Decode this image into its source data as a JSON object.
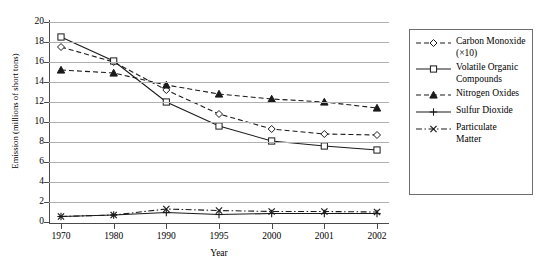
{
  "chart_data": {
    "type": "line",
    "title": "",
    "xlabel": "Year",
    "ylabel": "Emission (millions of short tons)",
    "categories": [
      "1970",
      "1980",
      "1990",
      "1995",
      "2000",
      "2001",
      "2002"
    ],
    "ylim": [
      0,
      20
    ],
    "ytick_step": 2,
    "yticks": [
      "20",
      "18",
      "16",
      "14",
      "12",
      "10",
      "8",
      "6",
      "4",
      "2",
      "0"
    ],
    "grid": true,
    "legend_position": "right",
    "series": [
      {
        "name": "Carbon Monoxide (×10)",
        "label_line1": "Carbon Monoxide",
        "label_line2": "(×10)",
        "marker": "diamond",
        "dash": "dashed",
        "values": [
          17.5,
          16.0,
          13.2,
          10.8,
          9.3,
          8.8,
          8.7
        ]
      },
      {
        "name": "Volatile Organic Compounds",
        "label_line1": "Volatile Organic",
        "label_line2": "Compounds",
        "marker": "square",
        "dash": "solid",
        "values": [
          18.5,
          16.1,
          12.0,
          9.6,
          8.1,
          7.6,
          7.2
        ]
      },
      {
        "name": "Nitrogen Oxides",
        "label_line1": "Nitrogen Oxides",
        "label_line2": "",
        "marker": "triangle",
        "dash": "dashed",
        "values": [
          15.2,
          14.9,
          13.7,
          12.8,
          12.3,
          12.0,
          11.4
        ]
      },
      {
        "name": "Sulfur Dioxide",
        "label_line1": "Sulfur Dioxide",
        "label_line2": "",
        "marker": "plus",
        "dash": "solid",
        "values": [
          0.55,
          0.7,
          0.95,
          0.75,
          0.85,
          0.85,
          0.85
        ]
      },
      {
        "name": "Particulate Matter",
        "label_line1": "Particulate",
        "label_line2": "Matter",
        "marker": "cross",
        "dash": "dashdot",
        "values": [
          0.55,
          0.7,
          1.3,
          1.15,
          1.05,
          1.05,
          1.0
        ]
      }
    ],
    "colors": {
      "line": "#1a1a1a",
      "grid": "#b0b0b0",
      "axis": "#4a4a4a",
      "background": "#ffffff"
    }
  }
}
